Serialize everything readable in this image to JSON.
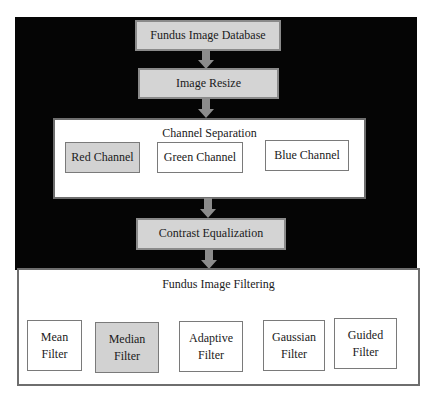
{
  "diagram": {
    "steps": {
      "database": "Fundus Image Database",
      "resize": "Image Resize",
      "contrast": "Contrast Equalization"
    },
    "channel_separation": {
      "title": "Channel Separation",
      "channels": [
        {
          "label": "Red Channel",
          "highlighted": true
        },
        {
          "label": "Green Channel",
          "highlighted": false
        },
        {
          "label": "Blue Channel",
          "highlighted": false
        }
      ]
    },
    "filtering": {
      "title": "Fundus Image Filtering",
      "filters": [
        {
          "line1": "Mean",
          "line2": "Filter",
          "highlighted": false
        },
        {
          "line1": "Median",
          "line2": "Filter",
          "highlighted": true
        },
        {
          "line1": "Adaptive",
          "line2": "Filter",
          "highlighted": false
        },
        {
          "line1": "Gaussian",
          "line2": "Filter",
          "highlighted": false
        },
        {
          "line1": "Guided",
          "line2": "Filter",
          "highlighted": false
        }
      ]
    },
    "colors": {
      "background": "#050505",
      "process_fill": "#d4d4d4",
      "highlight_fill": "#d2d2d2",
      "arrow": "#8c8c8c"
    }
  }
}
